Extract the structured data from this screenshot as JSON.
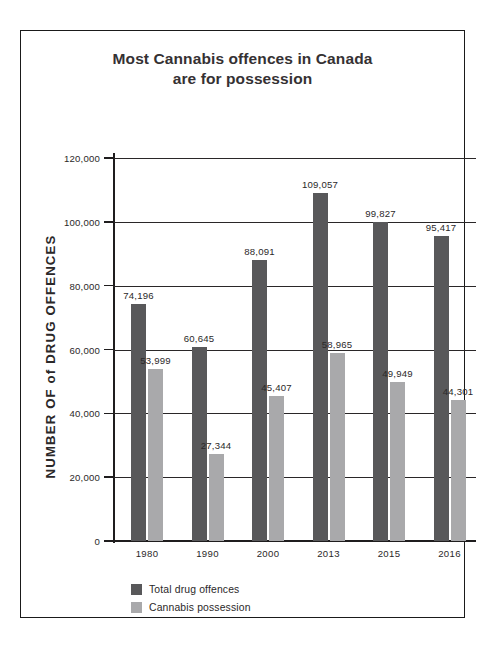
{
  "chart_data": {
    "type": "bar",
    "title": "Most Cannabis offences in Canada are for possession",
    "title_line1": "Most Cannabis offences in Canada",
    "title_line2": "are for possession",
    "xlabel": "",
    "ylabel": "NUMBER OF of DRUG OFFENCES",
    "ylim": [
      0,
      120000
    ],
    "grid": true,
    "legend_position": "bottom-left",
    "categories": [
      "1980",
      "1990",
      "2000",
      "2013",
      "2015",
      "2016"
    ],
    "ytick_labels": [
      "0",
      "20,000",
      "40,000",
      "60,000",
      "80,000",
      "100,000",
      "120,000"
    ],
    "ytick_values": [
      0,
      20000,
      40000,
      60000,
      80000,
      100000,
      120000
    ],
    "series": [
      {
        "name": "Total drug offences",
        "color": "#58585a",
        "values": [
          74196,
          60645,
          88091,
          109057,
          99827,
          95417
        ],
        "labels": [
          "74,196",
          "60,645",
          "88,091",
          "109,057",
          "99,827",
          "95,417"
        ]
      },
      {
        "name": "Cannabis possession",
        "color": "#a9a9ab",
        "values": [
          53999,
          27344,
          45407,
          58965,
          49949,
          44301
        ],
        "labels": [
          "53,999",
          "27,344",
          "45,407",
          "58,965",
          "49,949",
          "44,301"
        ]
      }
    ]
  },
  "colors": {
    "total_drug_offences": "#58585a",
    "cannabis_possession": "#a9a9ab",
    "axis": "#1f1d1e",
    "text": "#2b2829",
    "frame": "#1a1a1a"
  }
}
